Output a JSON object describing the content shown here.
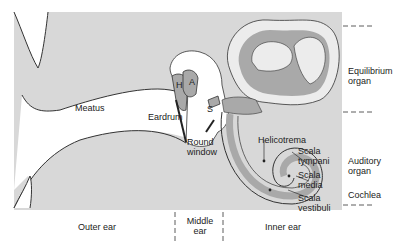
{
  "colors": {
    "background": "#ffffff",
    "tissue": "#d8d8d8",
    "membrane": "#a9a9a9",
    "fluid_light": "#ececec",
    "outline": "#333333"
  },
  "labels": {
    "meatus": "Meatus",
    "eardrum": "Eardrum",
    "hammer": "H",
    "anvil": "A",
    "stirrup": "S",
    "round_window_1": "Round",
    "round_window_2": "window",
    "helicotrema": "Helicotrema",
    "scala_tympani_1": "Scala",
    "scala_tympani_2": "tympani",
    "scala_media_1": "Scala",
    "scala_media_2": "media",
    "scala_vestibuli_1": "Scala",
    "scala_vestibuli_2": "vestibuli",
    "equilibrium_1": "Equilibrium",
    "equilibrium_2": "organ",
    "auditory_1": "Auditory",
    "auditory_2": "organ",
    "cochlea": "Cochlea"
  },
  "regions": {
    "outer_ear": "Outer ear",
    "middle_ear_1": "Middle",
    "middle_ear_2": "ear",
    "inner_ear": "Inner ear"
  }
}
